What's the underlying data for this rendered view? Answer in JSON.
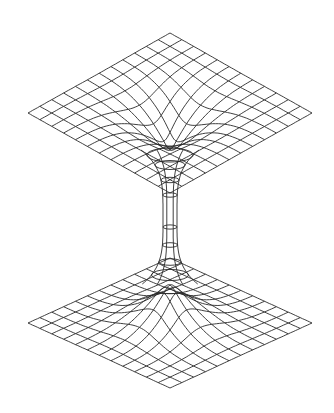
{
  "diagram": {
    "type": "wormhole-embedding-diagram",
    "stroke_color": "#2a2a2a",
    "background_color": "#ffffff",
    "top_sheet": {
      "center": [
        170,
        113
      ],
      "half_width": 142,
      "half_height": 80,
      "grid_lines": 12
    },
    "bottom_sheet": {
      "center": [
        170,
        323
      ],
      "half_width": 142,
      "half_height": 65,
      "grid_lines": 12
    },
    "throat": {
      "center_x": 170,
      "top_y": 150,
      "bottom_y": 285,
      "min_half_width": 7,
      "rings_y": [
        155,
        165,
        180,
        195,
        227,
        245,
        262,
        275
      ]
    }
  }
}
